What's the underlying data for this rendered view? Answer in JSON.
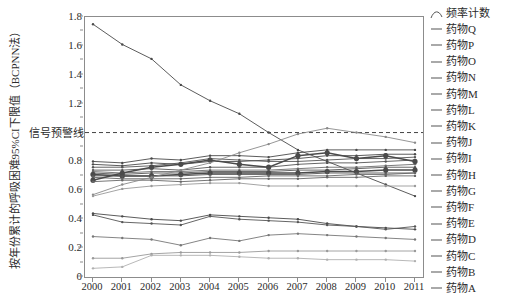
{
  "chart_data": {
    "type": "line",
    "title": "",
    "xlabel": "",
    "ylabel": "按年份累计的呼吸困难95%CI下限值（BCPNN法）",
    "categories": [
      "2000",
      "2001",
      "2002",
      "2003",
      "2004",
      "2005",
      "2006",
      "2007",
      "2008",
      "2009",
      "2010",
      "2011"
    ],
    "ylim": [
      0,
      1.8
    ],
    "xlim_labels": [
      "2000",
      "2011"
    ],
    "grid": false,
    "legend_position": "right",
    "yticks": [
      "0",
      "0.2",
      "0.4",
      "0.6",
      "0.8",
      "1",
      "1.2",
      "1.4",
      "1.6",
      "1.8"
    ],
    "ytick_values": [
      0,
      0.2,
      0.4,
      0.6,
      0.8,
      1.0,
      1.2,
      1.4,
      1.6,
      1.8
    ],
    "annotations": [
      {
        "name": "signal-warning-line",
        "text": "信号预警线",
        "y": 1.0,
        "style": "dashed"
      }
    ],
    "series": [
      {
        "name": "频率计数",
        "marker": "curve",
        "color": "#4a4a4a",
        "values": [
          1.75,
          1.61,
          1.51,
          1.33,
          1.22,
          1.13,
          1.0,
          0.88,
          0.8,
          0.72,
          0.64,
          0.56
        ]
      },
      {
        "name": "药物Q",
        "color": "#4a4a4a",
        "values": [
          0.8,
          0.79,
          0.82,
          0.81,
          0.84,
          0.84,
          0.83,
          0.86,
          0.88,
          0.88,
          0.88,
          0.88
        ]
      },
      {
        "name": "药物P",
        "color": "#4a4a4a",
        "values": [
          0.78,
          0.77,
          0.79,
          0.78,
          0.8,
          0.8,
          0.81,
          0.82,
          0.84,
          0.84,
          0.85,
          0.85
        ]
      },
      {
        "name": "药物O",
        "color": "#555555",
        "values": [
          0.76,
          0.76,
          0.77,
          0.79,
          0.82,
          0.81,
          0.8,
          0.8,
          0.81,
          0.82,
          0.82,
          0.83
        ]
      },
      {
        "name": "药物N",
        "color": "#555555",
        "values": [
          0.74,
          0.74,
          0.75,
          0.74,
          0.76,
          0.76,
          0.76,
          0.78,
          0.79,
          0.79,
          0.8,
          0.81
        ]
      },
      {
        "name": "药物M",
        "color": "#6b6b6b",
        "values": [
          0.73,
          0.72,
          0.73,
          0.73,
          0.74,
          0.74,
          0.74,
          0.75,
          0.76,
          0.76,
          0.77,
          0.78
        ]
      },
      {
        "name": "药物L",
        "color": "#555555",
        "values": [
          0.72,
          0.71,
          0.72,
          0.72,
          0.73,
          0.73,
          0.73,
          0.74,
          0.74,
          0.75,
          0.76,
          0.76
        ]
      },
      {
        "name": "药物K",
        "color": "#4a4a4a",
        "values": [
          0.71,
          0.7,
          0.7,
          0.71,
          0.72,
          0.72,
          0.72,
          0.72,
          0.73,
          0.73,
          0.74,
          0.74
        ],
        "emphasis": true
      },
      {
        "name": "药物J",
        "color": "#555555",
        "values": [
          0.7,
          0.7,
          0.7,
          0.7,
          0.71,
          0.71,
          0.71,
          0.71,
          0.72,
          0.72,
          0.72,
          0.72
        ]
      },
      {
        "name": "药物I",
        "color": "#666666",
        "values": [
          0.69,
          0.68,
          0.68,
          0.68,
          0.69,
          0.69,
          0.7,
          0.7,
          0.7,
          0.71,
          0.71,
          0.72
        ]
      },
      {
        "name": "药物H",
        "color": "#4a4a4a",
        "values": [
          0.67,
          0.72,
          0.76,
          0.78,
          0.81,
          0.78,
          0.76,
          0.84,
          0.86,
          0.82,
          0.84,
          0.8
        ],
        "emphasis": true
      },
      {
        "name": "药物G",
        "color": "#666666",
        "values": [
          0.66,
          0.67,
          0.67,
          0.66,
          0.67,
          0.68,
          0.68,
          0.68,
          0.69,
          0.69,
          0.7,
          0.7
        ]
      },
      {
        "name": "药物F",
        "color": "#8a8a8a",
        "values": [
          0.57,
          0.64,
          0.69,
          0.74,
          0.79,
          0.86,
          0.92,
          0.99,
          1.03,
          1.0,
          0.97,
          0.93
        ]
      },
      {
        "name": "药物E",
        "color": "#9a9a9a",
        "values": [
          0.56,
          0.61,
          0.63,
          0.64,
          0.65,
          0.65,
          0.63,
          0.63,
          0.63,
          0.63,
          0.63,
          0.63
        ]
      },
      {
        "name": "药物D",
        "color": "#4a4a4a",
        "values": [
          0.44,
          0.42,
          0.4,
          0.39,
          0.43,
          0.42,
          0.41,
          0.4,
          0.37,
          0.35,
          0.34,
          0.33
        ]
      },
      {
        "name": "药物C",
        "color": "#555555",
        "values": [
          0.43,
          0.38,
          0.37,
          0.36,
          0.42,
          0.4,
          0.39,
          0.38,
          0.36,
          0.35,
          0.33,
          0.35
        ]
      },
      {
        "name": "药物B",
        "color": "#777777",
        "values": [
          0.28,
          0.27,
          0.26,
          0.22,
          0.27,
          0.25,
          0.29,
          0.3,
          0.29,
          0.28,
          0.27,
          0.26
        ]
      },
      {
        "name": "药物A",
        "color": "#9a9a9a",
        "values": [
          0.13,
          0.13,
          0.16,
          0.17,
          0.17,
          0.17,
          0.18,
          0.18,
          0.18,
          0.18,
          0.18,
          0.18
        ]
      },
      {
        "name": "药物A2",
        "color": "#b0b0b0",
        "values": [
          0.06,
          0.07,
          0.15,
          0.15,
          0.15,
          0.14,
          0.13,
          0.13,
          0.12,
          0.12,
          0.12,
          0.11
        ]
      }
    ],
    "legend_entries": [
      "频率计数",
      "药物Q",
      "药物P",
      "药物O",
      "药物N",
      "药物M",
      "药物L",
      "药物K",
      "药物J",
      "药物I",
      "药物H",
      "药物G",
      "药物F",
      "药物E",
      "药物D",
      "药物C",
      "药物B",
      "药物A"
    ]
  }
}
